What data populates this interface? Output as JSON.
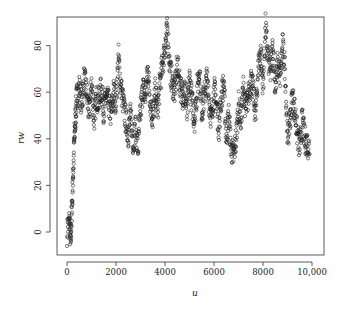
{
  "chart_data": {
    "type": "scatter",
    "title": "",
    "xlabel": "u",
    "ylabel": "rw",
    "xlim": [
      -400,
      10400
    ],
    "ylim": [
      -10,
      92
    ],
    "x_ticks": [
      0,
      2000,
      4000,
      6000,
      8000,
      10000
    ],
    "x_tick_labels": [
      "0",
      "2000",
      "4000",
      "6000",
      "8000",
      "10,000"
    ],
    "y_ticks": [
      0,
      20,
      40,
      60,
      80
    ],
    "y_tick_labels": [
      "0",
      "20",
      "40",
      "60",
      "80"
    ],
    "grid": false,
    "legend": null,
    "marker": "open-circle",
    "color": "#222222",
    "series": [
      {
        "name": "rw",
        "x": [
          0,
          100,
          150,
          200,
          250,
          300,
          350,
          400,
          500,
          600,
          700,
          800,
          900,
          1000,
          1100,
          1200,
          1300,
          1400,
          1500,
          1600,
          1700,
          1800,
          1900,
          2000,
          2100,
          2200,
          2300,
          2400,
          2500,
          2600,
          2700,
          2800,
          2900,
          3000,
          3100,
          3200,
          3300,
          3400,
          3500,
          3600,
          3700,
          3800,
          3900,
          4000,
          4100,
          4200,
          4300,
          4400,
          4500,
          4600,
          4700,
          4800,
          4900,
          5000,
          5100,
          5200,
          5300,
          5400,
          5500,
          5600,
          5700,
          5800,
          5900,
          6000,
          6100,
          6200,
          6300,
          6400,
          6500,
          6600,
          6700,
          6800,
          6900,
          7000,
          7100,
          7200,
          7300,
          7400,
          7500,
          7600,
          7700,
          7800,
          7900,
          8000,
          8100,
          8200,
          8300,
          8400,
          8500,
          8600,
          8700,
          8800,
          8900,
          9000,
          9100,
          9200,
          9300,
          9400,
          9500,
          9600,
          9700,
          9800,
          9900
        ],
        "y": [
          0,
          5,
          -5,
          10,
          25,
          40,
          50,
          58,
          62,
          55,
          66,
          60,
          50,
          64,
          48,
          58,
          56,
          62,
          52,
          58,
          55,
          50,
          60,
          56,
          75,
          62,
          55,
          48,
          42,
          50,
          38,
          45,
          35,
          52,
          62,
          58,
          70,
          56,
          48,
          60,
          52,
          65,
          72,
          80,
          87,
          70,
          64,
          60,
          72,
          65,
          58,
          62,
          50,
          66,
          56,
          48,
          60,
          70,
          52,
          58,
          66,
          56,
          48,
          62,
          55,
          45,
          58,
          64,
          40,
          50,
          36,
          32,
          40,
          55,
          48,
          62,
          52,
          58,
          66,
          60,
          50,
          70,
          78,
          62,
          88,
          75,
          68,
          80,
          62,
          72,
          66,
          80,
          70,
          40,
          48,
          58,
          52,
          42,
          36,
          48,
          40,
          38,
          36
        ]
      }
    ]
  }
}
